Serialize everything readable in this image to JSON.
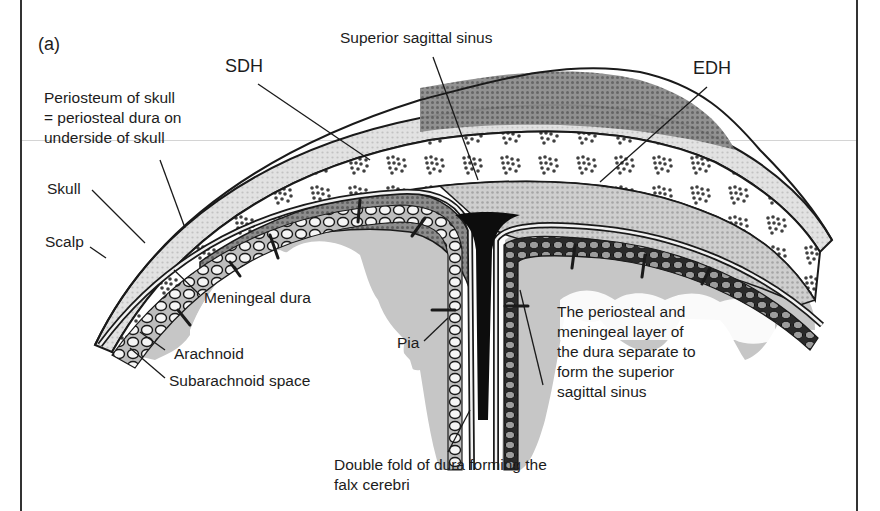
{
  "figure": {
    "panel_label": "(a)"
  },
  "labels": {
    "sdh": "SDH",
    "edh": "EDH",
    "superior_sagittal_sinus": "Superior sagittal sinus",
    "periosteum": {
      "line1": "Periosteum of skull",
      "line2": "= periosteal dura on",
      "line3": "underside of skull"
    },
    "skull": "Skull",
    "scalp": "Scalp",
    "meningeal_dura": "Meningeal dura",
    "arachnoid": "Arachnoid",
    "subarachnoid_space": "Subarachnoid space",
    "pia": "Pia",
    "dura_separation": {
      "line1": "The periosteal and",
      "line2": "meningeal layer of",
      "line3": "the dura separate to",
      "line4": "form the superior",
      "line5": "sagittal sinus"
    },
    "falx": {
      "line1": "Double fold of dura forming the",
      "line2": "falx cerebri"
    }
  },
  "colors": {
    "ink": "#1a1a1a",
    "background": "#ffffff",
    "brain_grey": "#c8c8c8",
    "sdh_fill": "#8a8a8a",
    "edh_fill": "#7a7a7a",
    "extradural_light": "#d9d9d9",
    "sinus": "#0d0d0d"
  }
}
